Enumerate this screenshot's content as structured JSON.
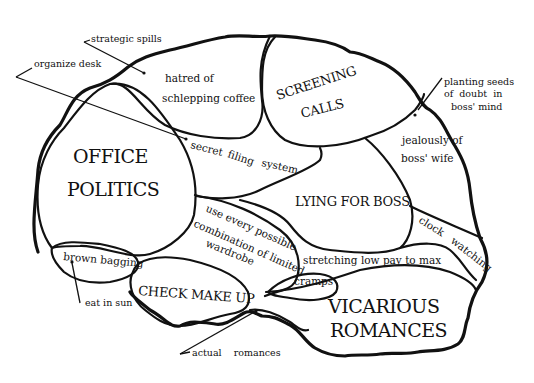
{
  "diagram": {
    "type": "brain-map",
    "regions": {
      "office_politics": [
        "OFFICE",
        "POLITICS"
      ],
      "screening_calls": [
        "SCREENING",
        "CALLS"
      ],
      "lying_for_boss": "LYING FOR BOSS",
      "check_make_up": "CHECK MAKE UP",
      "vicarious_romances": [
        "VICARIOUS",
        "ROMANCES"
      ],
      "hatred_coffee": [
        "hatred of",
        "schlepping coffee"
      ],
      "secret_filing": [
        "secret",
        "filing",
        "system"
      ],
      "wardrobe": [
        "use every possible",
        "combination of limited",
        "wardrobe"
      ],
      "jealously_wife": [
        "jealously of",
        "boss' wife"
      ],
      "clock_watching": [
        "clock",
        "watching"
      ],
      "stretching_pay": "stretching low pay to max",
      "cramps": "cramps",
      "brown_bagging": "brown bagging"
    },
    "annotations": {
      "strategic_spills": "strategic spills",
      "organize_desk": "organize desk",
      "planting_seeds": [
        "planting seeds",
        "of  doubt  in",
        "boss' mind"
      ],
      "eat_in_sun": "eat in sun",
      "actual_romances": "actual    romances"
    }
  }
}
